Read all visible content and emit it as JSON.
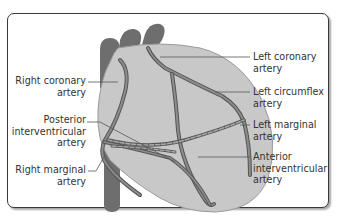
{
  "diagram": {
    "colors": {
      "frame_border": "#3a3a3a",
      "heart_fill": "#c8c8c8",
      "heart_outline": "#9a9a9a",
      "great_vessels": "#6e6e6e",
      "artery_fill": "#8c8c8c",
      "artery_edge": "#555555",
      "leader_line": "#555555",
      "text": "#333333"
    },
    "labels_left": [
      {
        "line1": "Right coronary",
        "line2": "artery"
      },
      {
        "line1": "Posterior",
        "line2": "interventricular",
        "line3": "artery"
      },
      {
        "line1": "Right marginal",
        "line2": "artery"
      }
    ],
    "labels_right": [
      {
        "line1": "Left coronary",
        "line2": "artery"
      },
      {
        "line1": "Left circumflex",
        "line2": "artery"
      },
      {
        "line1": "Left marginal",
        "line2": "artery"
      },
      {
        "line1": "Anterior",
        "line2": "interventricular",
        "line3": "artery"
      }
    ]
  }
}
